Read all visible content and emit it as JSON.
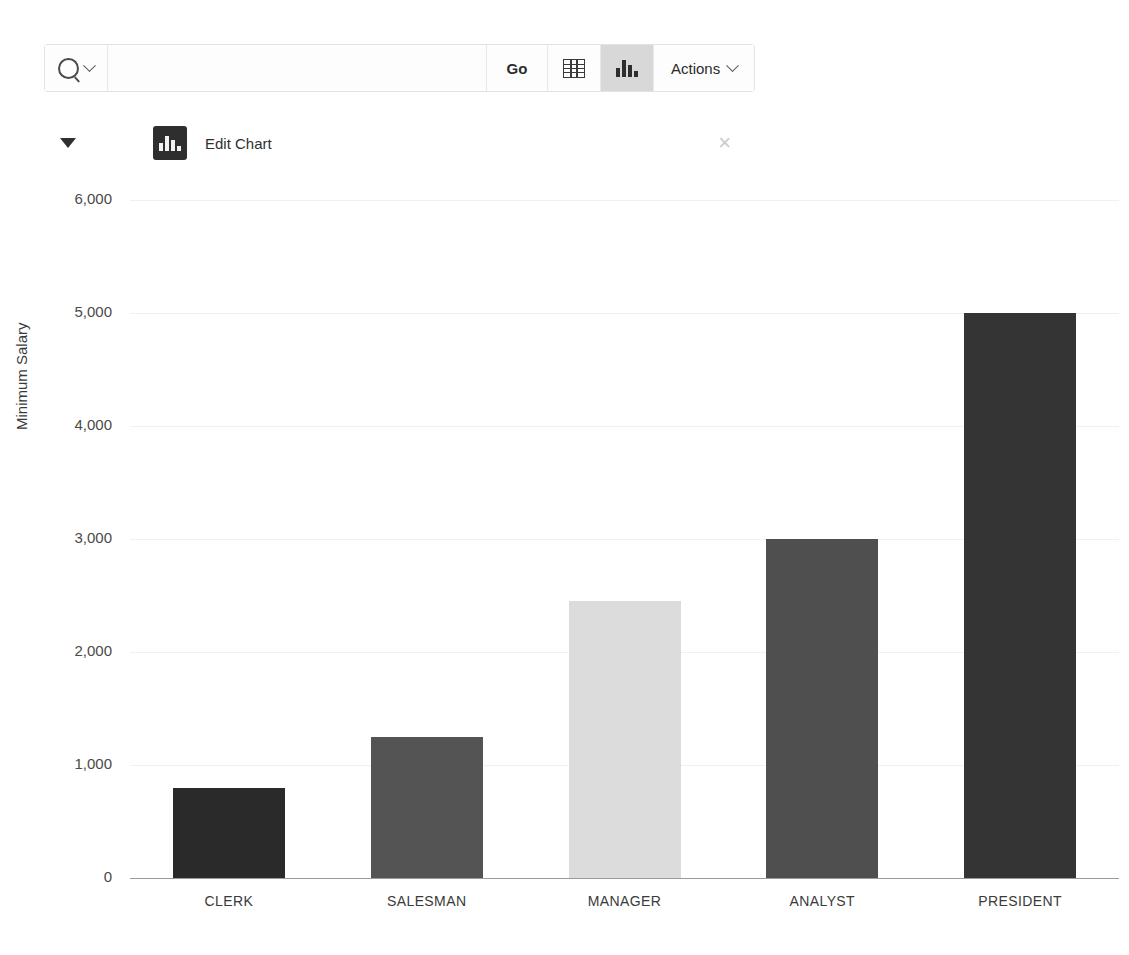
{
  "toolbar": {
    "search_icon": "search-icon",
    "search_chevron_icon": "chevron-down-icon",
    "search_value": "",
    "search_placeholder": "",
    "go_label": "Go",
    "grid_view_icon": "table-view-icon",
    "chart_view_icon": "chart-view-icon",
    "chart_view_active": true,
    "actions_label": "Actions",
    "actions_chevron_icon": "chevron-down-icon"
  },
  "edit_bar": {
    "collapse_icon": "triangle-down-icon",
    "badge_icon": "chart-icon",
    "title": "Edit Chart",
    "close_icon": "close-icon",
    "close_glyph": "×"
  },
  "chart_data": {
    "type": "bar",
    "title": "",
    "xlabel": "",
    "ylabel": "Minimum Salary",
    "categories": [
      "CLERK",
      "SALESMAN",
      "MANAGER",
      "ANALYST",
      "PRESIDENT"
    ],
    "values": [
      800,
      1250,
      2450,
      3000,
      5000
    ],
    "colors": [
      "#2a2a2a",
      "#545454",
      "#dcdcdc",
      "#4f4f4f",
      "#343434"
    ],
    "ylim": [
      0,
      6000
    ],
    "yticks": [
      0,
      1000,
      2000,
      3000,
      4000,
      5000,
      6000
    ],
    "ytick_labels": [
      "0",
      "1,000",
      "2,000",
      "3,000",
      "4,000",
      "5,000",
      "6,000"
    ],
    "grid": true,
    "legend": false
  }
}
